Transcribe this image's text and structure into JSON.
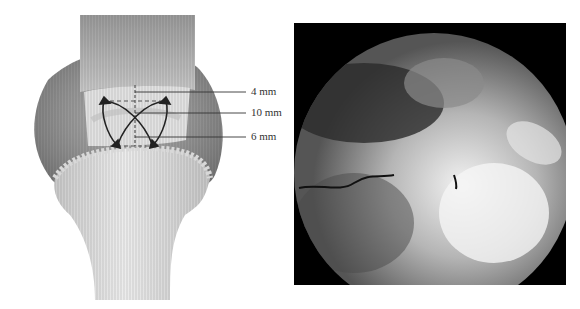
{
  "figure": {
    "left_panel": {
      "description": "Anatomical illustration of tendon repair with suture configuration and measurements",
      "measurements": [
        {
          "label": "4 mm",
          "y": 92
        },
        {
          "label": "10 mm",
          "y": 113
        },
        {
          "label": "6 mm",
          "y": 137
        }
      ]
    },
    "right_panel": {
      "description": "Arthroscopic view of repaired tendon"
    }
  }
}
